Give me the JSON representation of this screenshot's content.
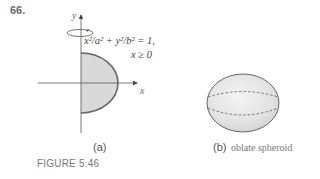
{
  "problem_number": "66.",
  "panel_a": {
    "label": "(a)",
    "axis_x": "x",
    "axis_y": "y",
    "equation_line1": "x²/a² + y²/b² = 1,",
    "equation_line2": "x ≥ 0",
    "fill_color": "#d9d9d9",
    "curve_color": "#666666"
  },
  "panel_b": {
    "label": "(b)",
    "caption": "oblate spheroid"
  },
  "figure_caption": "FIGURE 5.46"
}
